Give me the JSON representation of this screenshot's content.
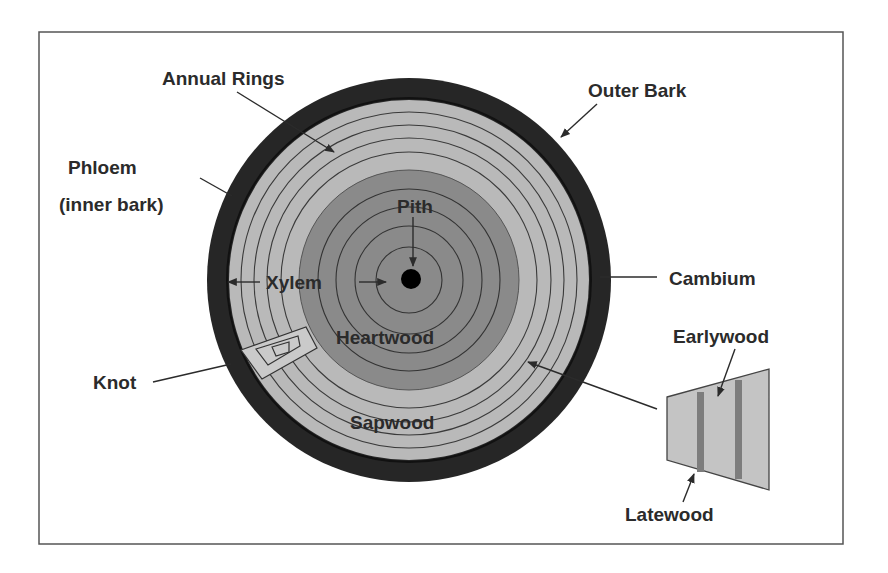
{
  "diagram": {
    "labels": {
      "annual_rings": "Annual Rings",
      "outer_bark": "Outer Bark",
      "phloem_line1": "Phloem",
      "phloem_line2": "(inner bark)",
      "pith": "Pith",
      "xylem": "Xylem",
      "cambium": "Cambium",
      "heartwood": "Heartwood",
      "knot": "Knot",
      "sapwood": "Sapwood",
      "earlywood": "Earlywood",
      "latewood": "Latewood"
    },
    "colors": {
      "outer_bark": "#262626",
      "sapwood": "#b9b9b9",
      "heartwood": "#8a8a8a",
      "pith": "#000000",
      "ring_line": "#3a3a3a",
      "knot_fill": "#c9c9c9",
      "wedge_fill": "#c4c4c4",
      "latewood_band": "#7d7d7d",
      "frame": "#555555",
      "text": "#2b2b2b"
    }
  }
}
